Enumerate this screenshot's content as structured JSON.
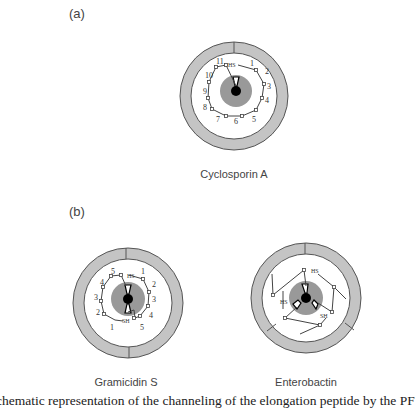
{
  "panels": {
    "a": {
      "label": "(a)",
      "caption": "Cyclosporin  A",
      "residues": [
        "1",
        "2",
        "3",
        "4",
        "5",
        "6",
        "7",
        "8",
        "9",
        "10",
        "11"
      ],
      "end_label": "HS"
    },
    "b": {
      "label": "(b)"
    },
    "b_left": {
      "caption": "Gramicidin  S",
      "residues_a": [
        "1",
        "2",
        "3",
        "4",
        "5"
      ],
      "residues_b": [
        "1",
        "2",
        "3",
        "4",
        "5"
      ],
      "end_labels": [
        "HS",
        "SH"
      ]
    },
    "b_right": {
      "caption": "Enterobactin",
      "end_labels": [
        "HS",
        "HS",
        "SH"
      ]
    }
  },
  "figure_caption": "chematic representation of the channeling of the elongation peptide by the PF",
  "colors": {
    "ring": "#b8b8b8",
    "ring_stroke": "#555555",
    "core": "#9a9a9a",
    "center": "#000000",
    "chain": "#444444"
  }
}
